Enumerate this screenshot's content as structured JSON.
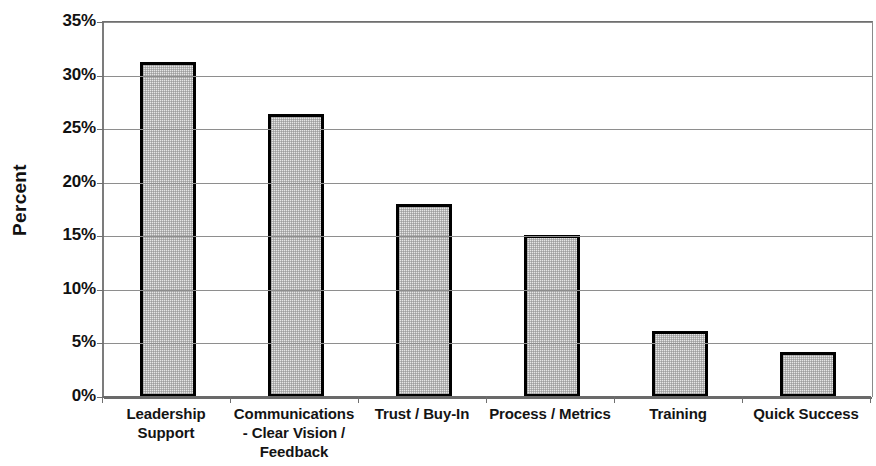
{
  "chart_data": {
    "type": "bar",
    "title": "",
    "subtitle": "",
    "xlabel": "",
    "ylabel": "Percent",
    "categories": [
      "Leadership Support",
      "Communications - Clear Vision / Feedback",
      "Trust / Buy-In",
      "Process / Metrics",
      "Training",
      "Quick Success"
    ],
    "category_lines": [
      [
        "Leadership",
        "Support"
      ],
      [
        "Communications",
        "- Clear Vision /",
        "Feedback"
      ],
      [
        "Trust / Buy-In"
      ],
      [
        "Process / Metrics"
      ],
      [
        "Training"
      ],
      [
        "Quick Success"
      ]
    ],
    "values": [
      31.3,
      26.4,
      18.0,
      15.1,
      6.2,
      4.2
    ],
    "value_unit": "%",
    "ylim": [
      0,
      35
    ],
    "ytick_step": 5,
    "ytick_labels": [
      "35%",
      "30%",
      "25%",
      "20%",
      "15%",
      "10%",
      "5%",
      "0%"
    ],
    "ytick_values": [
      35,
      30,
      25,
      20,
      15,
      10,
      5,
      0
    ],
    "grid": true,
    "grid_axis": "y",
    "legend": false,
    "legend_position": "none",
    "bar_fill_color": "#e6e6e6",
    "bar_edge_color": "#000000",
    "grid_color": "#8e8e8e",
    "axis_color": "#6a6a6a",
    "text_color": "#111111",
    "background_color": "#ffffff"
  },
  "axis": {
    "y_title": "Percent"
  }
}
